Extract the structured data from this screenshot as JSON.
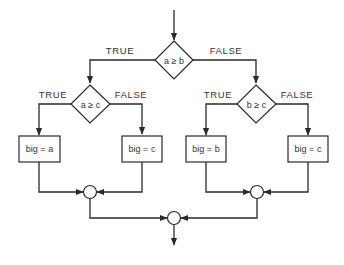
{
  "diagram": {
    "type": "flowchart",
    "colors": {
      "stroke": "#2a2a2a",
      "text": "#333333",
      "background": "#ffffff"
    },
    "decisions": [
      {
        "id": "d1",
        "condition": "a ≥ b",
        "true_label": "TRUE",
        "false_label": "FALSE"
      },
      {
        "id": "d2",
        "condition": "a ≥ c",
        "true_label": "TRUE",
        "false_label": "FALSE"
      },
      {
        "id": "d3",
        "condition": "b ≥ c",
        "true_label": "TRUE",
        "false_label": "FALSE"
      }
    ],
    "processes": [
      {
        "id": "p1",
        "text": "big = a"
      },
      {
        "id": "p2",
        "text": "big = c"
      },
      {
        "id": "p3",
        "text": "big = b"
      },
      {
        "id": "p4",
        "text": "big = c"
      }
    ],
    "junctions": [
      {
        "id": "j1"
      },
      {
        "id": "j2"
      },
      {
        "id": "j3"
      }
    ],
    "edges": [
      {
        "from": "start",
        "to": "d1"
      },
      {
        "from": "d1",
        "to": "d2",
        "label": "TRUE"
      },
      {
        "from": "d1",
        "to": "d3",
        "label": "FALSE"
      },
      {
        "from": "d2",
        "to": "p1",
        "label": "TRUE"
      },
      {
        "from": "d2",
        "to": "p2",
        "label": "FALSE"
      },
      {
        "from": "d3",
        "to": "p3",
        "label": "TRUE"
      },
      {
        "from": "d3",
        "to": "p4",
        "label": "FALSE"
      },
      {
        "from": "p1",
        "to": "j1"
      },
      {
        "from": "p2",
        "to": "j1"
      },
      {
        "from": "p3",
        "to": "j2"
      },
      {
        "from": "p4",
        "to": "j2"
      },
      {
        "from": "j1",
        "to": "j3"
      },
      {
        "from": "j2",
        "to": "j3"
      },
      {
        "from": "j3",
        "to": "end"
      }
    ]
  }
}
